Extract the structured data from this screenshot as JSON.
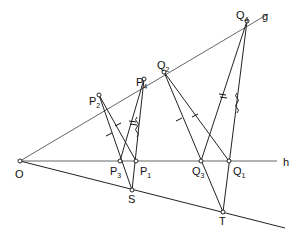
{
  "diagram": {
    "title": "",
    "lines": [
      {
        "name": "g",
        "label": "g"
      },
      {
        "name": "h",
        "label": "h"
      }
    ],
    "points": {
      "O": {
        "label": "O",
        "sub": ""
      },
      "P1": {
        "label": "P",
        "sub": "1"
      },
      "P2": {
        "label": "P",
        "sub": "2"
      },
      "P3": {
        "label": "P",
        "sub": "3"
      },
      "P4": {
        "label": "P",
        "sub": "4"
      },
      "Q1": {
        "label": "Q",
        "sub": "1"
      },
      "Q2": {
        "label": "Q",
        "sub": "2"
      },
      "Q3": {
        "label": "Q",
        "sub": "3"
      },
      "Q4": {
        "label": "Q",
        "sub": "4"
      },
      "S": {
        "label": "S",
        "sub": ""
      },
      "T": {
        "label": "T",
        "sub": ""
      }
    },
    "line_labels": {
      "g": "g",
      "h": "h"
    }
  }
}
